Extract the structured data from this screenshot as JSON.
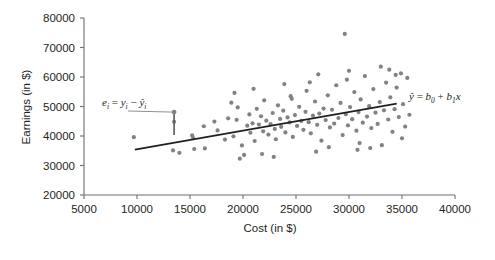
{
  "chart_data": {
    "type": "scatter",
    "title": "",
    "xlabel": "Cost (in $)",
    "ylabel": "Earnings (in $)",
    "xlim": [
      5000,
      40000
    ],
    "ylim": [
      20000,
      80000
    ],
    "xticks": [
      5000,
      10000,
      15000,
      20000,
      25000,
      30000,
      35000,
      40000
    ],
    "yticks": [
      20000,
      30000,
      40000,
      50000,
      60000,
      70000,
      80000
    ],
    "xtick_labels": [
      "5000",
      "10000",
      "15000",
      "20000",
      "25000",
      "30000",
      "35000",
      "40000"
    ],
    "ytick_labels": [
      "20000",
      "30000",
      "40000",
      "50000",
      "60000",
      "70000",
      "80000"
    ],
    "grid": false,
    "legend": "none",
    "point_color": "#808285",
    "line_color": "#231f20",
    "point_radius": 2.1,
    "series": [
      {
        "name": "observations",
        "points": [
          [
            9700,
            39600
          ],
          [
            13500,
            44800
          ],
          [
            13400,
            35100
          ],
          [
            14000,
            34300
          ],
          [
            15200,
            40200
          ],
          [
            15300,
            39300
          ],
          [
            15400,
            35600
          ],
          [
            16300,
            43300
          ],
          [
            16400,
            35800
          ],
          [
            17300,
            44900
          ],
          [
            17600,
            41900
          ],
          [
            18300,
            38800
          ],
          [
            18600,
            46000
          ],
          [
            19100,
            39900
          ],
          [
            19400,
            45500
          ],
          [
            19500,
            49700
          ],
          [
            19700,
            32300
          ],
          [
            19900,
            36800
          ],
          [
            20100,
            33600
          ],
          [
            20400,
            43500
          ],
          [
            20600,
            47300
          ],
          [
            20700,
            41100
          ],
          [
            20900,
            44300
          ],
          [
            21100,
            38300
          ],
          [
            21300,
            49200
          ],
          [
            21500,
            43900
          ],
          [
            21700,
            46700
          ],
          [
            21900,
            41600
          ],
          [
            22000,
            52100
          ],
          [
            22200,
            45200
          ],
          [
            22400,
            40500
          ],
          [
            22600,
            44000
          ],
          [
            22800,
            47800
          ],
          [
            23000,
            42400
          ],
          [
            23100,
            38900
          ],
          [
            23300,
            50400
          ],
          [
            23500,
            45800
          ],
          [
            23600,
            43100
          ],
          [
            23800,
            48600
          ],
          [
            24000,
            41200
          ],
          [
            24200,
            46300
          ],
          [
            24400,
            44600
          ],
          [
            24600,
            52600
          ],
          [
            24700,
            39700
          ],
          [
            24900,
            47100
          ],
          [
            25100,
            43400
          ],
          [
            25300,
            49900
          ],
          [
            25500,
            45100
          ],
          [
            25700,
            42100
          ],
          [
            25900,
            48200
          ],
          [
            26000,
            55300
          ],
          [
            26200,
            44700
          ],
          [
            26400,
            40900
          ],
          [
            26600,
            46900
          ],
          [
            26800,
            51700
          ],
          [
            27000,
            43800
          ],
          [
            27200,
            47600
          ],
          [
            27400,
            38400
          ],
          [
            27600,
            49300
          ],
          [
            27800,
            45400
          ],
          [
            28000,
            53800
          ],
          [
            28200,
            42900
          ],
          [
            28400,
            48900
          ],
          [
            28600,
            44200
          ],
          [
            28800,
            57200
          ],
          [
            29000,
            46100
          ],
          [
            29200,
            51200
          ],
          [
            29400,
            40300
          ],
          [
            29600,
            74600
          ],
          [
            29700,
            47400
          ],
          [
            29900,
            43600
          ],
          [
            30100,
            49800
          ],
          [
            30300,
            45700
          ],
          [
            30500,
            54900
          ],
          [
            30700,
            41800
          ],
          [
            30900,
            48100
          ],
          [
            31100,
            52400
          ],
          [
            31300,
            44500
          ],
          [
            31500,
            60300
          ],
          [
            31700,
            46600
          ],
          [
            31900,
            50100
          ],
          [
            32100,
            42700
          ],
          [
            32300,
            55900
          ],
          [
            32500,
            47900
          ],
          [
            32700,
            44100
          ],
          [
            32900,
            51500
          ],
          [
            33100,
            36900
          ],
          [
            33300,
            48700
          ],
          [
            33500,
            58100
          ],
          [
            33700,
            45600
          ],
          [
            33900,
            53100
          ],
          [
            34100,
            41400
          ],
          [
            34300,
            49100
          ],
          [
            34500,
            56400
          ],
          [
            34700,
            46400
          ],
          [
            34900,
            61200
          ],
          [
            35100,
            50800
          ],
          [
            35300,
            43200
          ],
          [
            35500,
            59700
          ],
          [
            35700,
            47200
          ],
          [
            21800,
            33900
          ],
          [
            22900,
            32900
          ],
          [
            26900,
            34700
          ],
          [
            30800,
            35300
          ],
          [
            19200,
            54600
          ],
          [
            23900,
            57600
          ],
          [
            27100,
            60900
          ],
          [
            30000,
            62100
          ],
          [
            33000,
            63500
          ],
          [
            34400,
            60700
          ],
          [
            35000,
            39200
          ],
          [
            32000,
            35900
          ],
          [
            18900,
            51300
          ],
          [
            21000,
            56000
          ],
          [
            24500,
            53500
          ],
          [
            29800,
            59100
          ],
          [
            31000,
            37600
          ],
          [
            33800,
            62500
          ],
          [
            26300,
            58200
          ],
          [
            28100,
            36200
          ]
        ]
      }
    ],
    "fit_line": {
      "label": "y-hat = b0 + b1 x",
      "x_start": 9800,
      "y_start": 35400,
      "x_end": 34500,
      "y_end": 51000
    },
    "annotations": [
      {
        "name": "residual-label",
        "text": "e_i = y_i - y-hat_i",
        "x": 13500,
        "y": 52000
      },
      {
        "name": "residual-segment",
        "x": 13500,
        "y_top": 48100,
        "y_bottom": 40300
      }
    ]
  },
  "labels": {
    "y_axis_title": "Earnings (in $)",
    "x_axis_title": "Cost (in $)",
    "fit_equation": {
      "lhs": "ŷ",
      "eq": " = ",
      "b0": "b",
      "b0_sub": "0",
      "plus": " + ",
      "b1": "b",
      "b1_sub": "1",
      "x": "x"
    },
    "residual_equation": {
      "e": "e",
      "e_sub": "i",
      "eq": " = ",
      "y": "y",
      "y_sub": "i",
      "minus": " − ",
      "yhat": "ŷ",
      "yhat_sub": "i"
    }
  }
}
